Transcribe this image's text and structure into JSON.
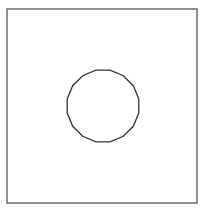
{
  "diagram": {
    "frame": {
      "x": 7,
      "y": 9,
      "width": 190,
      "height": 194,
      "stroke": "#555555"
    },
    "shape": {
      "type": "polygon-circle",
      "cx": 103,
      "cy": 106,
      "r": 36.5,
      "sides": 16,
      "stroke": "#333333"
    }
  }
}
